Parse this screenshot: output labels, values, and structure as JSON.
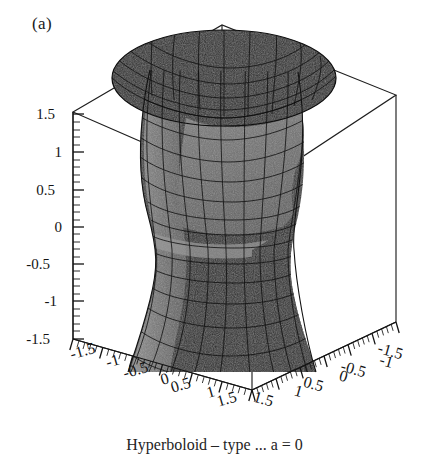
{
  "panel": {
    "label": "(a)"
  },
  "caption": {
    "text": "Hyperboloid – type ... a = 0"
  },
  "colors": {
    "background": "#ffffff",
    "box_line": "#1e1e1e",
    "axis_line": "#141414",
    "tick": "#141414",
    "surface_outer_dark": "#2b2b2b",
    "surface_outer_mid": "#3a3a3a",
    "surface_inner_light": "#6f6f6f",
    "surface_inner_pale": "#8a8a8a",
    "mesh_line": "#0d0d0d",
    "highlight_band": "#9a9a9a",
    "text": "#141414"
  },
  "chart_data": {
    "type": "surface3d",
    "title": "(a)",
    "surface_name": "hyperboloid-of-one-sheet",
    "equation": "x^2 + y^2 - z^2 = 1",
    "xlabel": "",
    "ylabel": "",
    "zlabel": "",
    "xlim": [
      -1.5,
      1.5
    ],
    "ylim": [
      -1.5,
      1.5
    ],
    "zlim": [
      -1.5,
      1.5
    ],
    "grid": false,
    "legend": "none",
    "bounding_box": true,
    "mesh_wireframe": true,
    "shading": "grayscale",
    "z_axis": {
      "name": "z-axis",
      "position": "left",
      "ticks": [
        1.5,
        1,
        0.5,
        0,
        -0.5,
        -1,
        -1.5
      ],
      "tick_labels": [
        "1.5",
        "1",
        "0.5",
        "0",
        "-0.5",
        "-1",
        "-1.5"
      ],
      "minor_ticks_per_interval": 4
    },
    "x_axis": {
      "name": "x-axis",
      "position": "bottom-left",
      "ticks": [
        -1.5,
        -1,
        -0.5,
        0,
        0.5,
        1,
        1.5
      ],
      "tick_labels": [
        "-1.5",
        "-1",
        "-0.5",
        "0",
        "0.5",
        "1",
        "1.5"
      ],
      "minor_ticks_per_interval": 4
    },
    "y_axis": {
      "name": "y-axis",
      "position": "bottom-right",
      "ticks": [
        1.5,
        1,
        0.5,
        0,
        -0.5,
        -1,
        -1.5
      ],
      "tick_labels": [
        "1.5",
        "1",
        "0.5",
        "0",
        "-0.5",
        "-1",
        "-1.5"
      ],
      "minor_ticks_per_interval": 4
    }
  },
  "z_ticks": [
    {
      "label": "1.5",
      "x": 55,
      "y": 114
    },
    {
      "label": "1",
      "x": 62,
      "y": 152
    },
    {
      "label": "0.5",
      "x": 55,
      "y": 190
    },
    {
      "label": "0",
      "x": 62,
      "y": 227
    },
    {
      "label": "-0.5",
      "x": 50,
      "y": 264
    },
    {
      "label": "-1",
      "x": 57,
      "y": 301
    },
    {
      "label": "-1.5",
      "x": 50,
      "y": 339
    }
  ],
  "x_ticks": [
    {
      "label": "-1.5",
      "x": 84,
      "y": 356,
      "rot": -16
    },
    {
      "label": "-1",
      "x": 114,
      "y": 366,
      "rot": -16
    },
    {
      "label": "-0.5",
      "x": 137,
      "y": 375,
      "rot": -16
    },
    {
      "label": "0",
      "x": 166,
      "y": 384,
      "rot": -16
    },
    {
      "label": "0.5",
      "x": 182,
      "y": 390,
      "rot": -16
    },
    {
      "label": "1",
      "x": 212,
      "y": 397,
      "rot": -16
    },
    {
      "label": "1.5",
      "x": 228,
      "y": 404,
      "rot": -16
    }
  ],
  "y_ticks": [
    {
      "label": "1.5",
      "x": 262,
      "y": 404,
      "rot": 16
    },
    {
      "label": "1",
      "x": 297,
      "y": 396,
      "rot": 16
    },
    {
      "label": "0.5",
      "x": 312,
      "y": 389,
      "rot": 16
    },
    {
      "label": "0",
      "x": 342,
      "y": 381,
      "rot": 16
    },
    {
      "label": "-0.5",
      "x": 352,
      "y": 374,
      "rot": 16
    },
    {
      "label": "-1",
      "x": 385,
      "y": 366,
      "rot": 16
    },
    {
      "label": "-1.5",
      "x": 389,
      "y": 356,
      "rot": 16
    }
  ]
}
